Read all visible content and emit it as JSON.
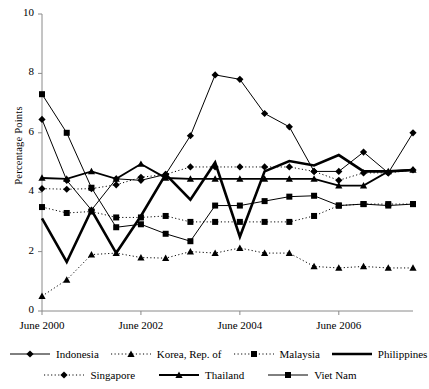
{
  "chart_data": {
    "type": "line",
    "title": "",
    "xlabel": "",
    "ylabel": "Percentage Points",
    "ylim": [
      0,
      10
    ],
    "yticks": [
      0,
      2,
      4,
      6,
      8,
      10
    ],
    "ytick_labels": [
      "0",
      "2",
      "4",
      "6",
      "8",
      "10"
    ],
    "grid": false,
    "legend_position": "bottom",
    "x": [
      "Jun 2000",
      "Dec 2000",
      "Jun 2001",
      "Dec 2001",
      "Jun 2002",
      "Dec 2002",
      "Jun 2003",
      "Dec 2003",
      "Jun 2004",
      "Dec 2004",
      "Jun 2005",
      "Dec 2005",
      "Jun 2006",
      "Dec 2006",
      "Jun 2007",
      "Dec 2007"
    ],
    "xtick_labels": [
      "June 2000",
      "June 2002",
      "June 2004",
      "June 2006"
    ],
    "xtick_indices": [
      0,
      4,
      8,
      12
    ],
    "series": [
      {
        "name": "Indonesia",
        "style": "solid",
        "marker": "diamond",
        "width": "thin",
        "values": [
          6.45,
          4.4,
          3.4,
          4.45,
          4.4,
          4.6,
          5.9,
          7.95,
          7.8,
          6.65,
          6.2,
          4.7,
          4.7,
          5.35,
          4.65,
          6.0
        ]
      },
      {
        "name": "Korea, Rep. of",
        "style": "dotted",
        "marker": "triangle",
        "width": "thin",
        "values": [
          0.5,
          1.05,
          1.9,
          1.95,
          1.8,
          1.78,
          2.0,
          1.95,
          2.12,
          1.95,
          1.95,
          1.5,
          1.45,
          1.5,
          1.45,
          1.45
        ]
      },
      {
        "name": "Malaysia",
        "style": "dotted",
        "marker": "square",
        "width": "thin",
        "values": [
          3.5,
          3.3,
          3.35,
          3.15,
          3.15,
          3.2,
          3.0,
          3.0,
          3.0,
          3.0,
          3.0,
          3.2,
          3.55,
          3.6,
          3.6,
          3.6
        ]
      },
      {
        "name": "Philippines",
        "style": "solid",
        "marker": "none",
        "width": "thick",
        "values": [
          3.12,
          1.65,
          3.4,
          1.95,
          3.2,
          4.6,
          3.75,
          5.0,
          2.5,
          4.7,
          5.05,
          4.9,
          5.25,
          4.7,
          4.7,
          4.75
        ]
      },
      {
        "name": "Singapore",
        "style": "dotted",
        "marker": "diamond",
        "width": "thin",
        "values": [
          4.12,
          4.1,
          4.12,
          4.25,
          4.5,
          4.6,
          4.85,
          4.85,
          4.85,
          4.85,
          4.85,
          4.7,
          4.4,
          4.65,
          4.65,
          4.75
        ]
      },
      {
        "name": "Thailand",
        "style": "solid",
        "marker": "triangle",
        "width": "medium",
        "values": [
          4.48,
          4.45,
          4.7,
          4.45,
          4.95,
          4.48,
          4.45,
          4.45,
          4.45,
          4.45,
          4.45,
          4.45,
          4.22,
          4.22,
          4.7,
          4.75
        ]
      },
      {
        "name": "Viet Nam",
        "style": "solid",
        "marker": "square",
        "width": "thin",
        "values": [
          7.3,
          6.0,
          4.15,
          2.82,
          2.92,
          2.6,
          2.35,
          3.55,
          3.55,
          3.7,
          3.85,
          3.88,
          3.55,
          3.6,
          3.55,
          3.6
        ]
      }
    ]
  },
  "legend": {
    "rows": [
      [
        "Indonesia",
        "Korea, Rep. of",
        "Malaysia",
        "Philippines"
      ],
      [
        "Singapore",
        "Thailand",
        "Viet Nam"
      ]
    ]
  }
}
